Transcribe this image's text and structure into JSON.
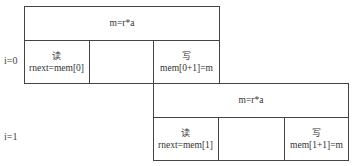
{
  "rows": [
    {
      "label": "i=0",
      "compute": "m=r*a",
      "read": {
        "title": "读",
        "expr": "rnext=mem[0]"
      },
      "middle": "",
      "write": {
        "title": "写",
        "expr": "mem[0+1]=m"
      }
    },
    {
      "label": "i=1",
      "compute": "m=r*a",
      "read": {
        "title": "读",
        "expr": "rnext=mem[1]"
      },
      "middle": "",
      "write": {
        "title": "写",
        "expr": "mem[1+1]=m"
      }
    }
  ]
}
